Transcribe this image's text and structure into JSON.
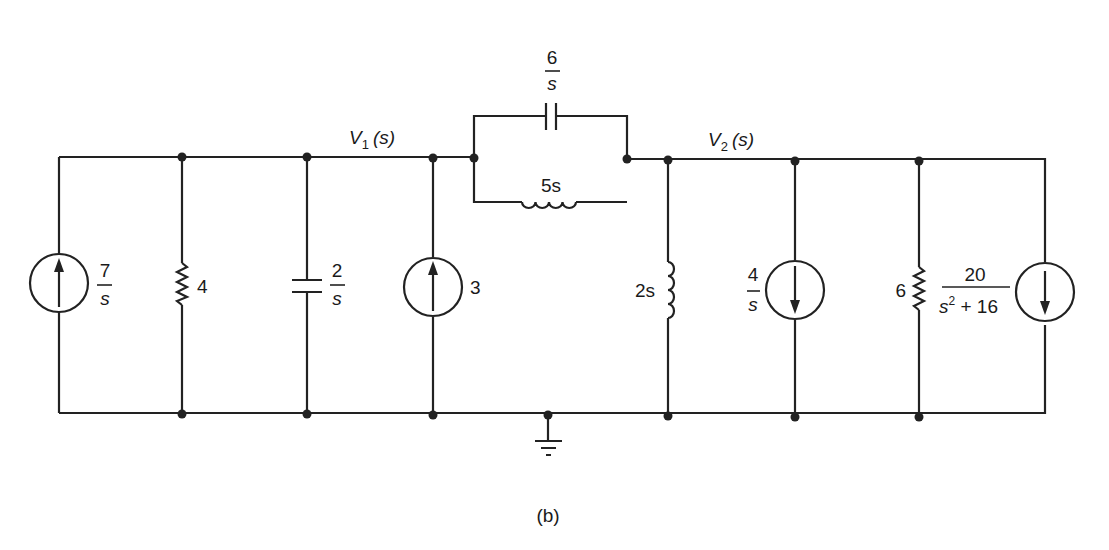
{
  "figure": {
    "caption": "(b)",
    "nodes": {
      "v1_label": "V",
      "v1_sub": "1",
      "v1_arg": "(s)",
      "v2_label": "V",
      "v2_sub": "2",
      "v2_arg": "(s)"
    },
    "components": {
      "source_left": {
        "type": "current-source",
        "direction": "up",
        "num": "7",
        "den": "s"
      },
      "resistor_left": {
        "type": "resistor",
        "value": "4"
      },
      "capacitor_left": {
        "type": "capacitor",
        "num": "2",
        "den": "s"
      },
      "source_mid": {
        "type": "current-source",
        "direction": "up",
        "value": "3"
      },
      "series_capacitor": {
        "type": "capacitor",
        "num": "6",
        "den": "s"
      },
      "series_inductor": {
        "type": "inductor",
        "value": "5s"
      },
      "inductor_right": {
        "type": "inductor",
        "value": "2s"
      },
      "source_right1": {
        "type": "current-source",
        "direction": "down",
        "num": "4",
        "den": "s"
      },
      "resistor_right": {
        "type": "resistor",
        "value": "6"
      },
      "source_right2": {
        "type": "current-source",
        "direction": "down",
        "num": "20",
        "den_base": "s",
        "den_exp": "2",
        "den_rest": " + 16"
      }
    },
    "ground": {
      "type": "ground"
    }
  }
}
